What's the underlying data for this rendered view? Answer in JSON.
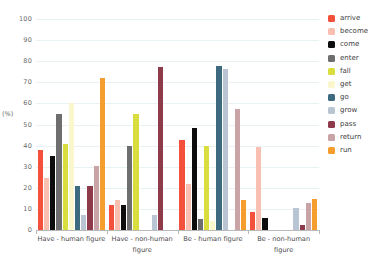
{
  "chart_data": {
    "type": "bar",
    "title": "",
    "xlabel": "",
    "ylabel": "(%)",
    "ylim": [
      0,
      100
    ],
    "ytick_step": 10,
    "yticks": [
      0,
      10,
      20,
      30,
      40,
      50,
      60,
      70,
      80,
      90,
      100
    ],
    "grid": true,
    "legend_position": "right",
    "categories": [
      "Have - human figure",
      "Have - non-human figure",
      "Be - human figure",
      "Be - non-human figure"
    ],
    "series": [
      {
        "name": "arrive",
        "color": "#F4513C",
        "values": [
          38.0,
          12.0,
          42.5,
          8.5
        ]
      },
      {
        "name": "become",
        "color": "#F9C0B2",
        "values": [
          24.8,
          14.0,
          22.0,
          39.5
        ]
      },
      {
        "name": "come",
        "color": "#0D0D0D",
        "values": [
          35.2,
          12.0,
          48.5,
          5.5
        ]
      },
      {
        "name": "enter",
        "color": "#6E6E6E",
        "values": [
          55.0,
          40.0,
          5.0,
          0.0
        ]
      },
      {
        "name": "fall",
        "color": "#D9DD3E",
        "values": [
          41.0,
          55.0,
          40.0,
          0.0
        ]
      },
      {
        "name": "get",
        "color": "#FAF6CE",
        "values": [
          60.0,
          0.0,
          4.5,
          0.0
        ]
      },
      {
        "name": "go",
        "color": "#3E6A80",
        "values": [
          21.0,
          0.0,
          77.5,
          0.0
        ]
      },
      {
        "name": "grow",
        "color": "#BAC5D3",
        "values": [
          7.0,
          7.0,
          76.5,
          10.5
        ]
      },
      {
        "name": "pass",
        "color": "#8E3A4B",
        "values": [
          21.0,
          77.3,
          0.0,
          2.5
        ]
      },
      {
        "name": "return",
        "color": "#C9A4A6",
        "values": [
          30.3,
          0.0,
          57.3,
          13.0
        ]
      },
      {
        "name": "run",
        "color": "#F59E2E",
        "values": [
          72.2,
          0.0,
          14.3,
          14.5
        ]
      }
    ]
  }
}
